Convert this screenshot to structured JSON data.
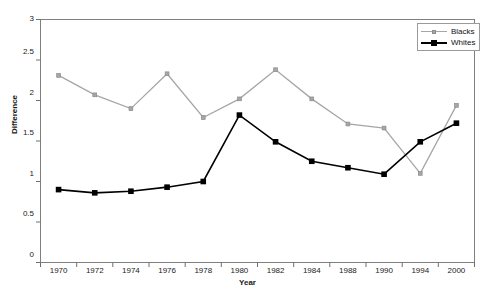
{
  "chart_data": {
    "type": "line",
    "title": "",
    "subtitle": "",
    "xlabel": "Year",
    "ylabel": "Difference",
    "categories": [
      "1970",
      "1972",
      "1974",
      "1976",
      "1978",
      "1980",
      "1982",
      "1984",
      "1988",
      "1990",
      "1994",
      "2000"
    ],
    "ylim": [
      0,
      3
    ],
    "yticks": [
      "0",
      "0.5",
      "1",
      "1.5",
      "2",
      "2.5",
      "3"
    ],
    "ytick_values": [
      0,
      0.5,
      1,
      1.5,
      2,
      2.5,
      3
    ],
    "grid": false,
    "legend_position": "top-right",
    "series": [
      {
        "name": "Blacks",
        "color": "#a6a6a6",
        "marker": "diamond",
        "values": [
          2.31,
          2.07,
          1.9,
          2.33,
          1.79,
          2.02,
          2.38,
          2.02,
          1.71,
          1.66,
          1.1,
          1.94
        ]
      },
      {
        "name": "Whites",
        "color": "#000000",
        "marker": "square",
        "values": [
          0.9,
          0.86,
          0.88,
          0.93,
          1.0,
          1.82,
          1.49,
          1.25,
          1.17,
          1.09,
          1.49,
          1.72
        ]
      }
    ]
  },
  "legend": {
    "items": [
      {
        "label": "Blacks"
      },
      {
        "label": "Whites"
      }
    ]
  },
  "axes": {
    "y_title": "Difference",
    "x_title": "Year"
  },
  "colors": {
    "blacks_series": "#a6a6a6",
    "whites_series": "#000000",
    "frame": "#7f7f7f",
    "background": "#ffffff"
  }
}
